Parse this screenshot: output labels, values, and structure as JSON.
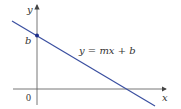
{
  "diagram": {
    "type": "linear-function-graph",
    "equation": "y = mx + b",
    "axes": {
      "x_label": "x",
      "y_label": "y",
      "origin_label": "0"
    },
    "intercept_label": "b",
    "colors": {
      "line": "#3a4fa0",
      "axis": "#555555",
      "point": "#1f2f8a",
      "text": "#333333"
    }
  }
}
